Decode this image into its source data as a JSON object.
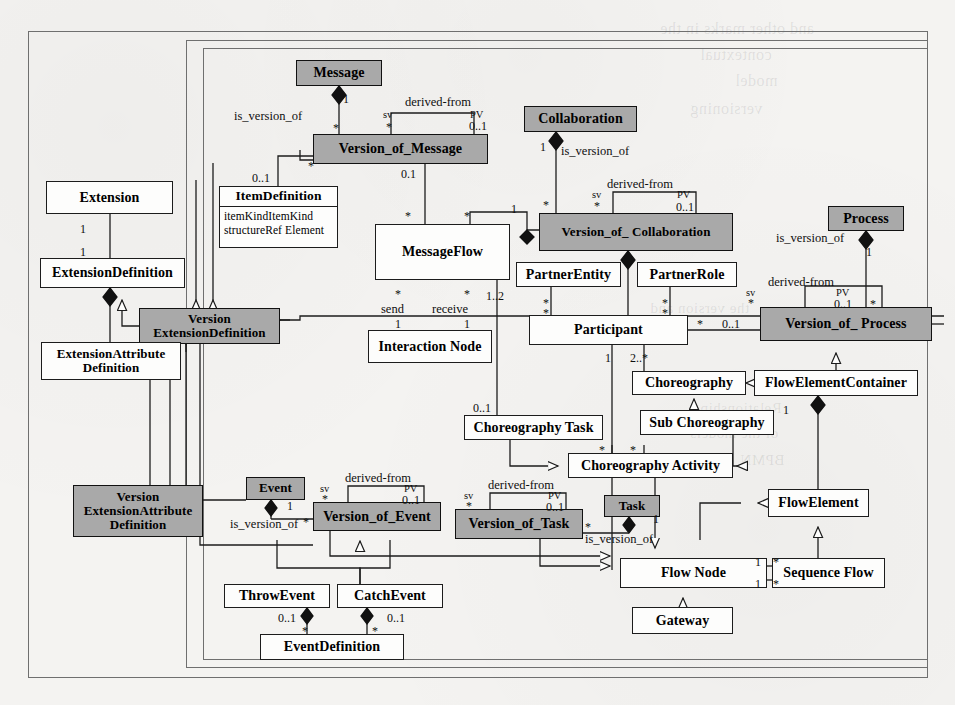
{
  "diagram": {
    "type": "uml-class-diagram",
    "shaded_fill": "#a9a9a9",
    "plain_fill": "#fdfdfc",
    "stroke": "#1c1c1c"
  },
  "classes": [
    {
      "id": "message",
      "name": "Message",
      "shaded": true,
      "x": 296,
      "y": 60,
      "w": 86,
      "h": 26
    },
    {
      "id": "version_of_message",
      "name": "Version_of_Message",
      "shaded": true,
      "x": 313,
      "y": 134,
      "w": 175,
      "h": 30
    },
    {
      "id": "collaboration",
      "name": "Collaboration",
      "shaded": true,
      "x": 524,
      "y": 106,
      "w": 113,
      "h": 26
    },
    {
      "id": "version_of_collab",
      "name": "Version_of_ Collaboration",
      "shaded": true,
      "x": 539,
      "y": 213,
      "w": 194,
      "h": 38
    },
    {
      "id": "process",
      "name": "Process",
      "shaded": true,
      "x": 828,
      "y": 206,
      "w": 76,
      "h": 25
    },
    {
      "id": "version_of_process",
      "name": "Version_of_ Process",
      "shaded": true,
      "x": 760,
      "y": 307,
      "w": 172,
      "h": 34
    },
    {
      "id": "extension",
      "name": "Extension",
      "shaded": false,
      "x": 46,
      "y": 181,
      "w": 127,
      "h": 33
    },
    {
      "id": "extension_def",
      "name": "ExtensionDefinition",
      "shaded": false,
      "x": 40,
      "y": 258,
      "w": 145,
      "h": 30
    },
    {
      "id": "version_ext_def",
      "name": "Version\nExtensionDefinition",
      "shaded": true,
      "x": 139,
      "y": 308,
      "w": 141,
      "h": 36
    },
    {
      "id": "ext_attr_def",
      "name": "ExtensionAttribute\nDefinition",
      "shaded": false,
      "x": 41,
      "y": 342,
      "w": 140,
      "h": 38
    },
    {
      "id": "version_ext_attr",
      "name": "Version\nExtensionAttribute\nDefinition",
      "shaded": true,
      "x": 73,
      "y": 485,
      "w": 130,
      "h": 52
    },
    {
      "id": "item_definition",
      "name": "ItemDefinition",
      "shaded": false,
      "x": 219,
      "y": 186,
      "w": 119,
      "h": 62,
      "attributes": [
        "itemKindItemKind",
        "structureRef Element"
      ]
    },
    {
      "id": "message_flow",
      "name": "MessageFlow",
      "shaded": false,
      "x": 375,
      "y": 224,
      "w": 135,
      "h": 56
    },
    {
      "id": "interaction_node",
      "name": "Interaction Node",
      "shaded": false,
      "x": 368,
      "y": 330,
      "w": 124,
      "h": 33
    },
    {
      "id": "partner_entity",
      "name": "PartnerEntity",
      "shaded": false,
      "x": 516,
      "y": 262,
      "w": 105,
      "h": 25
    },
    {
      "id": "partner_role",
      "name": "PartnerRole",
      "shaded": false,
      "x": 637,
      "y": 262,
      "w": 100,
      "h": 25
    },
    {
      "id": "participant",
      "name": "Participant",
      "shaded": false,
      "x": 529,
      "y": 315,
      "w": 159,
      "h": 30
    },
    {
      "id": "choreography",
      "name": "Choreography",
      "shaded": false,
      "x": 632,
      "y": 371,
      "w": 114,
      "h": 24
    },
    {
      "id": "flow_elem_cont",
      "name": "FlowElementContainer",
      "shaded": false,
      "x": 754,
      "y": 370,
      "w": 164,
      "h": 26
    },
    {
      "id": "sub_choreography",
      "name": "Sub Choreography",
      "shaded": false,
      "x": 640,
      "y": 410,
      "w": 134,
      "h": 25
    },
    {
      "id": "choreography_task",
      "name": "Choreography Task",
      "shaded": false,
      "x": 464,
      "y": 415,
      "w": 139,
      "h": 25
    },
    {
      "id": "choreo_activity",
      "name": "Choreography Activity",
      "shaded": false,
      "x": 568,
      "y": 453,
      "w": 165,
      "h": 25
    },
    {
      "id": "flow_element",
      "name": "FlowElement",
      "shaded": false,
      "x": 768,
      "y": 489,
      "w": 101,
      "h": 28
    },
    {
      "id": "event",
      "name": "Event",
      "shaded": true,
      "x": 246,
      "y": 477,
      "w": 59,
      "h": 23
    },
    {
      "id": "version_of_event",
      "name": "Version_of_Event",
      "shaded": true,
      "x": 313,
      "y": 502,
      "w": 128,
      "h": 29
    },
    {
      "id": "version_of_task",
      "name": "Version_of_Task",
      "shaded": true,
      "x": 455,
      "y": 509,
      "w": 128,
      "h": 30
    },
    {
      "id": "task",
      "name": "Task",
      "shaded": true,
      "x": 604,
      "y": 495,
      "w": 56,
      "h": 22
    },
    {
      "id": "throw_event",
      "name": "ThrowEvent",
      "shaded": false,
      "x": 224,
      "y": 584,
      "w": 106,
      "h": 24
    },
    {
      "id": "catch_event",
      "name": "CatchEvent",
      "shaded": false,
      "x": 337,
      "y": 584,
      "w": 106,
      "h": 24
    },
    {
      "id": "event_definition",
      "name": "EventDefinition",
      "shaded": false,
      "x": 260,
      "y": 634,
      "w": 144,
      "h": 26
    },
    {
      "id": "flow_node",
      "name": "Flow Node",
      "shaded": false,
      "x": 620,
      "y": 558,
      "w": 147,
      "h": 30
    },
    {
      "id": "sequence_flow",
      "name": "Sequence Flow",
      "shaded": false,
      "x": 772,
      "y": 558,
      "w": 113,
      "h": 30
    },
    {
      "id": "gateway",
      "name": "Gateway",
      "shaded": false,
      "x": 632,
      "y": 607,
      "w": 101,
      "h": 27
    }
  ],
  "labels": [
    {
      "id": "l1",
      "text": "is_version_of",
      "kind": "role",
      "x": 234,
      "y": 110
    },
    {
      "id": "l2",
      "text": "1",
      "kind": "mult",
      "x": 343,
      "y": 93
    },
    {
      "id": "l3",
      "text": "*",
      "kind": "mult",
      "x": 333,
      "y": 122
    },
    {
      "id": "l4",
      "text": "derived-from",
      "kind": "df",
      "x": 405,
      "y": 96
    },
    {
      "id": "l5",
      "text": "sv",
      "kind": "sv",
      "x": 383,
      "y": 110
    },
    {
      "id": "l6",
      "text": "PV",
      "kind": "sv",
      "x": 470,
      "y": 110
    },
    {
      "id": "l7",
      "text": "*",
      "kind": "mult",
      "x": 386,
      "y": 121
    },
    {
      "id": "l8",
      "text": "0..1",
      "kind": "mult",
      "x": 469,
      "y": 120
    },
    {
      "id": "l9",
      "text": "*",
      "kind": "mult",
      "x": 308,
      "y": 160
    },
    {
      "id": "l10",
      "text": "0..1",
      "kind": "mult",
      "x": 252,
      "y": 172
    },
    {
      "id": "l11",
      "text": "0.1",
      "kind": "mult",
      "x": 401,
      "y": 168
    },
    {
      "id": "l12",
      "text": "*",
      "kind": "mult",
      "x": 405,
      "y": 210
    },
    {
      "id": "l13",
      "text": "is_version_of",
      "kind": "role",
      "x": 561,
      "y": 145
    },
    {
      "id": "l14",
      "text": "1",
      "kind": "mult",
      "x": 540,
      "y": 141
    },
    {
      "id": "l15",
      "text": "*",
      "kind": "mult",
      "x": 543,
      "y": 199
    },
    {
      "id": "l16",
      "text": "derived-from",
      "kind": "df",
      "x": 607,
      "y": 178
    },
    {
      "id": "l17",
      "text": "sv",
      "kind": "sv",
      "x": 592,
      "y": 190
    },
    {
      "id": "l18",
      "text": "PV",
      "kind": "sv",
      "x": 677,
      "y": 190
    },
    {
      "id": "l19",
      "text": "*",
      "kind": "mult",
      "x": 594,
      "y": 200
    },
    {
      "id": "l20",
      "text": "0..1",
      "kind": "mult",
      "x": 676,
      "y": 201
    },
    {
      "id": "l21",
      "text": "1",
      "kind": "mult",
      "x": 511,
      "y": 203
    },
    {
      "id": "l22",
      "text": "*",
      "kind": "mult",
      "x": 464,
      "y": 210
    },
    {
      "id": "l23",
      "text": "is_version_of",
      "kind": "role",
      "x": 776,
      "y": 232
    },
    {
      "id": "l24",
      "text": "1",
      "kind": "mult",
      "x": 866,
      "y": 246
    },
    {
      "id": "l25",
      "text": "derived-from",
      "kind": "df",
      "x": 768,
      "y": 276
    },
    {
      "id": "l26",
      "text": "sv",
      "kind": "sv",
      "x": 746,
      "y": 288
    },
    {
      "id": "l27",
      "text": "PV",
      "kind": "sv",
      "x": 836,
      "y": 288
    },
    {
      "id": "l28",
      "text": "*",
      "kind": "mult",
      "x": 748,
      "y": 297
    },
    {
      "id": "l29",
      "text": "0..1",
      "kind": "mult",
      "x": 834,
      "y": 298
    },
    {
      "id": "l30",
      "text": "*",
      "kind": "mult",
      "x": 870,
      "y": 298
    },
    {
      "id": "l31",
      "text": "1",
      "kind": "mult",
      "x": 80,
      "y": 223
    },
    {
      "id": "l32",
      "text": "1",
      "kind": "mult",
      "x": 80,
      "y": 246
    },
    {
      "id": "l33",
      "text": "send",
      "kind": "role",
      "x": 381,
      "y": 303
    },
    {
      "id": "l34",
      "text": "receive",
      "kind": "role",
      "x": 432,
      "y": 303
    },
    {
      "id": "l35",
      "text": "*",
      "kind": "mult",
      "x": 395,
      "y": 288
    },
    {
      "id": "l36",
      "text": "*",
      "kind": "mult",
      "x": 464,
      "y": 288
    },
    {
      "id": "l37",
      "text": "1",
      "kind": "mult",
      "x": 395,
      "y": 318
    },
    {
      "id": "l38",
      "text": "1",
      "kind": "mult",
      "x": 464,
      "y": 318
    },
    {
      "id": "l39",
      "text": "1..2",
      "kind": "mult",
      "x": 486,
      "y": 290
    },
    {
      "id": "l40",
      "text": "*",
      "kind": "mult",
      "x": 543,
      "y": 297
    },
    {
      "id": "l41",
      "text": "*",
      "kind": "mult",
      "x": 543,
      "y": 307
    },
    {
      "id": "l42",
      "text": "*",
      "kind": "mult",
      "x": 662,
      "y": 297
    },
    {
      "id": "l43",
      "text": "*",
      "kind": "mult",
      "x": 662,
      "y": 307
    },
    {
      "id": "l44",
      "text": "*",
      "kind": "mult",
      "x": 697,
      "y": 318
    },
    {
      "id": "l45",
      "text": "0..1",
      "kind": "mult",
      "x": 722,
      "y": 318
    },
    {
      "id": "l46",
      "text": "1",
      "kind": "mult",
      "x": 605,
      "y": 352
    },
    {
      "id": "l47",
      "text": "2..*",
      "kind": "mult",
      "x": 630,
      "y": 352
    },
    {
      "id": "l48",
      "text": "1",
      "kind": "mult",
      "x": 783,
      "y": 404
    },
    {
      "id": "l49",
      "text": "0..1",
      "kind": "mult",
      "x": 473,
      "y": 402
    },
    {
      "id": "l50",
      "text": "*",
      "kind": "mult",
      "x": 599,
      "y": 444
    },
    {
      "id": "l51",
      "text": "*",
      "kind": "mult",
      "x": 630,
      "y": 444
    },
    {
      "id": "l52",
      "text": "is_version_of",
      "kind": "role",
      "x": 230,
      "y": 518
    },
    {
      "id": "l53",
      "text": "1",
      "kind": "mult",
      "x": 287,
      "y": 500
    },
    {
      "id": "l54",
      "text": "*",
      "kind": "mult",
      "x": 303,
      "y": 516
    },
    {
      "id": "l55",
      "text": "derived-from",
      "kind": "df",
      "x": 345,
      "y": 472
    },
    {
      "id": "l56",
      "text": "sv",
      "kind": "sv",
      "x": 320,
      "y": 484
    },
    {
      "id": "l57",
      "text": "PV",
      "kind": "sv",
      "x": 404,
      "y": 484
    },
    {
      "id": "l58",
      "text": "*",
      "kind": "mult",
      "x": 322,
      "y": 493
    },
    {
      "id": "l59",
      "text": "0..1",
      "kind": "mult",
      "x": 402,
      "y": 494
    },
    {
      "id": "l60",
      "text": "derived-from",
      "kind": "df",
      "x": 488,
      "y": 479
    },
    {
      "id": "l61",
      "text": "sv",
      "kind": "sv",
      "x": 464,
      "y": 491
    },
    {
      "id": "l62",
      "text": "PV",
      "kind": "sv",
      "x": 548,
      "y": 491
    },
    {
      "id": "l63",
      "text": "*",
      "kind": "mult",
      "x": 466,
      "y": 500
    },
    {
      "id": "l64",
      "text": "0..1",
      "kind": "mult",
      "x": 546,
      "y": 501
    },
    {
      "id": "l65",
      "text": "*",
      "kind": "mult",
      "x": 585,
      "y": 521
    },
    {
      "id": "l66",
      "text": "1",
      "kind": "mult",
      "x": 653,
      "y": 513
    },
    {
      "id": "l67",
      "text": "is_version_of",
      "kind": "role",
      "x": 585,
      "y": 533
    },
    {
      "id": "l68",
      "text": "0..1",
      "kind": "mult",
      "x": 278,
      "y": 612
    },
    {
      "id": "l69",
      "text": "0..1",
      "kind": "mult",
      "x": 387,
      "y": 612
    },
    {
      "id": "l70",
      "text": "*",
      "kind": "mult",
      "x": 302,
      "y": 625
    },
    {
      "id": "l71",
      "text": "*",
      "kind": "mult",
      "x": 372,
      "y": 625
    },
    {
      "id": "l72",
      "text": "1",
      "kind": "mult",
      "x": 755,
      "y": 556
    },
    {
      "id": "l73",
      "text": "*",
      "kind": "mult",
      "x": 773,
      "y": 556
    },
    {
      "id": "l74",
      "text": "1",
      "kind": "mult",
      "x": 755,
      "y": 578
    },
    {
      "id": "l75",
      "text": "*",
      "kind": "mult",
      "x": 773,
      "y": 578
    }
  ],
  "frames": [
    {
      "id": "outer",
      "x": 28,
      "y": 31,
      "w": 898,
      "h": 645
    },
    {
      "id": "mid",
      "x": 186,
      "y": 40,
      "w": 740,
      "h": 626
    },
    {
      "id": "inner",
      "x": 203,
      "y": 48,
      "w": 723,
      "h": 610
    }
  ],
  "ghost_text": [
    {
      "id": "g1",
      "text": "and other marks in the",
      "x": 660,
      "y": 20,
      "size": 16
    },
    {
      "id": "g2",
      "text": "contextual",
      "x": 700,
      "y": 46,
      "size": 16
    },
    {
      "id": "g3",
      "text": "model",
      "x": 735,
      "y": 72,
      "size": 16
    },
    {
      "id": "g4",
      "text": "versioning",
      "x": 690,
      "y": 100,
      "size": 16
    },
    {
      "id": "g5",
      "text": "the version and",
      "x": 650,
      "y": 300,
      "size": 15
    },
    {
      "id": "g6",
      "text": "Relationship",
      "x": 700,
      "y": 400,
      "size": 15
    },
    {
      "id": "g7",
      "text": "of the models",
      "x": 690,
      "y": 425,
      "size": 15
    },
    {
      "id": "g8",
      "text": "BPMN",
      "x": 740,
      "y": 452,
      "size": 15
    }
  ]
}
